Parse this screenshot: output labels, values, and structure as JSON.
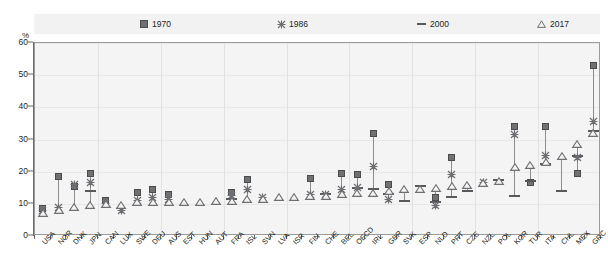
{
  "chart_data": {
    "type": "scatter",
    "title": "",
    "subtitle": "",
    "xlabel": "",
    "ylabel": "%",
    "ylim": [
      0,
      60
    ],
    "yticks": [
      0,
      10,
      20,
      30,
      40,
      50,
      60
    ],
    "grid": true,
    "legend_position": "top",
    "legend": [
      "1970",
      "1986",
      "2000",
      "2017"
    ],
    "markers": {
      "1970": "filled-square",
      "1986": "x-cross",
      "2000": "horizontal-dash",
      "2017": "open-triangle"
    },
    "colors": {
      "1970": "#707173",
      "1986": "#6d6e71",
      "2000": "#58595b",
      "2017": "#6d6e71",
      "plot_background": "#f4f4f4",
      "legend_background": "#f2f2f2",
      "axis": "#6b6b6b",
      "gridline": "#e2e2e2"
    },
    "categories": [
      "USA",
      "NOR",
      "DNK",
      "JPN",
      "CAN",
      "LUX",
      "SWE",
      "DEU",
      "AUS",
      "EST",
      "HUN",
      "AUT",
      "FRA",
      "ISL",
      "SVN",
      "LVA",
      "ISR",
      "FIN",
      "CHE",
      "BEL",
      "OECD",
      "IRL",
      "GBR",
      "SVK",
      "ESP",
      "NLD",
      "PRT",
      "CZE",
      "NZL",
      "POL",
      "KOR",
      "TUR",
      "ITA",
      "CHL",
      "MEX",
      "GRC"
    ],
    "series": [
      {
        "name": "1970",
        "values": [
          8.5,
          18.5,
          15.5,
          19.5,
          11.0,
          null,
          13.5,
          14.5,
          13.0,
          null,
          null,
          null,
          13.5,
          17.5,
          null,
          null,
          null,
          18.0,
          null,
          19.5,
          19.0,
          32.0,
          16.0,
          null,
          null,
          12.0,
          24.5,
          null,
          null,
          null,
          34.0,
          16.5,
          34.0,
          null,
          19.5,
          53.0
        ]
      },
      {
        "name": "1986",
        "values": [
          8.0,
          9.0,
          16.0,
          16.5,
          10.0,
          8.0,
          11.0,
          12.0,
          11.5,
          null,
          null,
          null,
          12.5,
          14.5,
          12.0,
          null,
          null,
          13.0,
          13.0,
          14.5,
          15.0,
          21.5,
          11.5,
          null,
          null,
          9.5,
          19.0,
          null,
          16.5,
          null,
          31.5,
          null,
          25.0,
          null,
          24.5,
          35.5
        ]
      },
      {
        "name": "2000",
        "values": [
          null,
          null,
          null,
          14.0,
          null,
          null,
          null,
          null,
          null,
          null,
          null,
          null,
          11.5,
          null,
          null,
          null,
          null,
          null,
          13.0,
          null,
          15.0,
          14.5,
          13.0,
          11.0,
          15.5,
          10.5,
          12.0,
          14.0,
          null,
          17.5,
          12.5,
          17.0,
          22.5,
          14.0,
          25.0,
          32.5
        ]
      },
      {
        "name": "2017",
        "values": [
          7.0,
          8.0,
          9.0,
          9.5,
          10.0,
          9.5,
          10.5,
          10.5,
          10.5,
          10.5,
          10.5,
          11.0,
          11.0,
          11.5,
          11.5,
          12.0,
          12.0,
          12.5,
          12.5,
          13.0,
          13.5,
          13.5,
          14.0,
          14.5,
          14.5,
          15.0,
          15.5,
          16.0,
          16.5,
          17.0,
          21.5,
          22.0,
          23.0,
          25.0,
          28.5,
          32.0
        ]
      }
    ]
  },
  "axis": {
    "y_unit_label": "%",
    "y_tick_labels": [
      "0",
      "10",
      "20",
      "30",
      "40",
      "50",
      "60"
    ],
    "x_tick_labels": [
      "USA",
      "NOR",
      "DNK",
      "JPN",
      "CAN",
      "LUX",
      "SWE",
      "DEU",
      "AUS",
      "EST",
      "HUN",
      "AUT",
      "FRA",
      "ISL",
      "SVN",
      "LVA",
      "ISR",
      "FIN",
      "CHE",
      "BEL",
      "OECD",
      "IRL",
      "GBR",
      "SVK",
      "ESP",
      "NLD",
      "PRT",
      "CZE",
      "NZL",
      "POL",
      "KOR",
      "TUR",
      "ITA",
      "CHL",
      "MEX",
      "GRC"
    ]
  },
  "legend": {
    "items": [
      {
        "label": "1970",
        "icon": "filled-square-icon"
      },
      {
        "label": "1986",
        "icon": "x-cross-icon"
      },
      {
        "label": "2000",
        "icon": "dash-icon"
      },
      {
        "label": "2017",
        "icon": "triangle-icon"
      }
    ]
  }
}
